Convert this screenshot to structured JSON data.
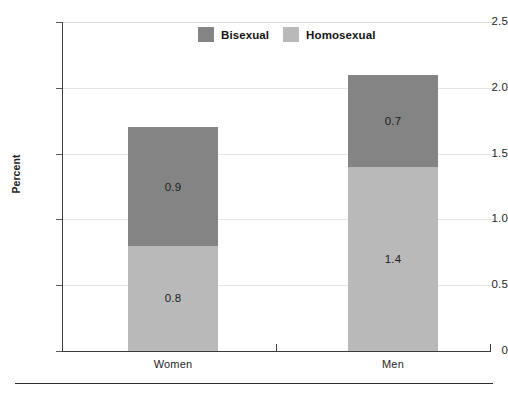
{
  "chart_data": {
    "type": "bar",
    "subtype": "stacked-vertical",
    "title": "",
    "xlabel": "",
    "ylabel": "Percent",
    "ylim": [
      0,
      2.5
    ],
    "yticks": [
      "0",
      "0.5",
      "1.0",
      "1.5",
      "2.0",
      "2.5"
    ],
    "ytick_values": [
      0,
      0.5,
      1.0,
      1.5,
      2.0,
      2.5
    ],
    "grid": true,
    "grid_axis": "y",
    "legend_position": "top-center",
    "categories": [
      "Women",
      "Men"
    ],
    "series": [
      {
        "name": "Homosexual",
        "color": "#b9b9b9",
        "values": [
          0.8,
          1.4
        ],
        "labels": [
          "0.8",
          "1.4"
        ]
      },
      {
        "name": "Bisexual",
        "color": "#848484",
        "values": [
          0.9,
          0.7
        ],
        "labels": [
          "0.9",
          "0.7"
        ]
      }
    ],
    "totals": [
      1.7,
      2.1
    ],
    "legend": [
      {
        "label": "Bisexual",
        "color": "#848484"
      },
      {
        "label": "Homosexual",
        "color": "#b9b9b9"
      }
    ]
  },
  "axis": {
    "y_title": "Percent",
    "ticks": [
      {
        "label": "2.5",
        "value": 2.5
      },
      {
        "label": "2.0",
        "value": 2.0
      },
      {
        "label": "1.5",
        "value": 1.5
      },
      {
        "label": "1.0",
        "value": 1.0
      },
      {
        "label": "0.5",
        "value": 0.5
      },
      {
        "label": "0",
        "value": 0
      }
    ],
    "x_labels": [
      "Women",
      "Men"
    ]
  },
  "colors": {
    "bisexual": "#848484",
    "homosexual": "#b9b9b9",
    "axis": "#3a3a3a",
    "gridline": "#e6e6e8",
    "rule": "#2e2e2e",
    "text": "#1f1f1f"
  }
}
